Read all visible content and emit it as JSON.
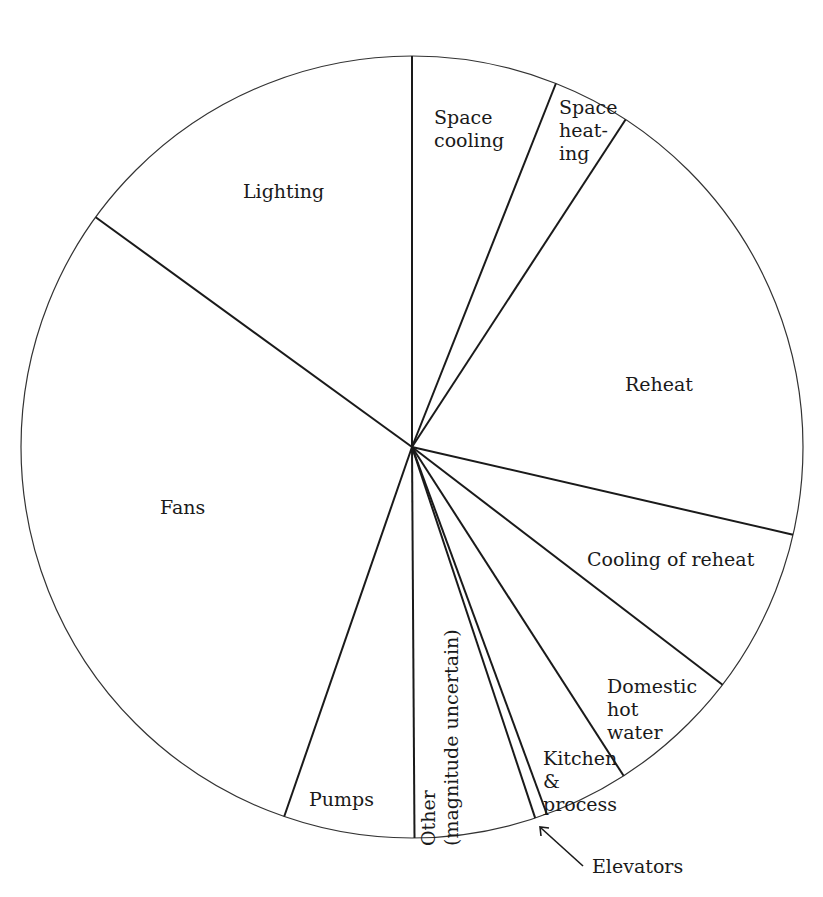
{
  "chart_data": {
    "type": "pie",
    "title": "",
    "start_angle_deg": 0,
    "direction": "clockwise",
    "units": "estimated percent of total (read from slice angles; no numeric labels shown)",
    "categories": [
      "Space cooling",
      "Space heating",
      "Reheat",
      "Cooling of reheat",
      "Domestic hot water",
      "Kitchen & process",
      "Elevators",
      "Other (magnitude uncertain)",
      "Pumps",
      "Fans",
      "Lighting"
    ],
    "values": [
      6.0,
      3.2,
      19.4,
      6.8,
      5.5,
      3.5,
      0.5,
      5.0,
      5.4,
      29.7,
      15.0
    ],
    "labels_display": {
      "space_cooling": "Space\ncooling",
      "space_heating": "Space\nheat-\ning",
      "reheat": "Reheat",
      "cooling_of_reheat": "Cooling of reheat",
      "domestic_hot_water": "Domestic\nhot\nwater",
      "kitchen_process": "Kitchen\n&\nprocess",
      "elevators": "Elevators",
      "other": "Other\n(magnitude uncertain)",
      "pumps": "Pumps",
      "fans": "Fans",
      "lighting": "Lighting"
    },
    "legend": "none (labels inside slices; Elevators labelled with arrow callout)",
    "colors": {
      "fill": "#ffffff",
      "stroke": "#1a1a1a"
    }
  }
}
